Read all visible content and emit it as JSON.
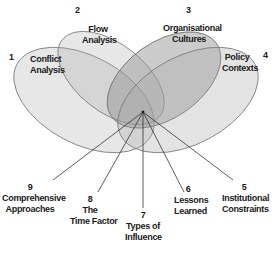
{
  "diagram": {
    "type": "venn-with-spokes",
    "colors": {
      "ellipse_fill": "#9a9a9a",
      "ellipse_stroke": "#6e6e6e",
      "spoke": "#333333",
      "text": "#1a1a1a"
    },
    "center": {
      "x": 143,
      "y": 112
    },
    "sets": [
      {
        "number": "1",
        "line1": "Conflict",
        "line2": "Analysis"
      },
      {
        "number": "2",
        "line1": "Flow",
        "line2": "Analysis"
      },
      {
        "number": "3",
        "line1": "Organisational",
        "line2": "Cultures"
      },
      {
        "number": "4",
        "line1": "Policy",
        "line2": "Contexts"
      }
    ],
    "spokes": [
      {
        "number": "5",
        "line1": "Institutional",
        "line2": "Constraints",
        "line3": ""
      },
      {
        "number": "6",
        "line1": "Lessons",
        "line2": "Learned",
        "line3": ""
      },
      {
        "number": "7",
        "line1": "Types of",
        "line2": "Influence",
        "line3": ""
      },
      {
        "number": "8",
        "line1": "The",
        "line2": "Time Factor",
        "line3": ""
      },
      {
        "number": "9",
        "line1": "Comprehensive",
        "line2": "Approaches",
        "line3": ""
      }
    ]
  }
}
